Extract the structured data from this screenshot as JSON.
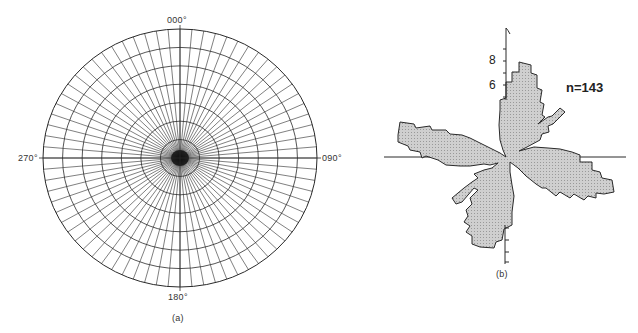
{
  "chart_data": [
    {
      "type": "polar-grid",
      "panel_label": "(a)",
      "title": "",
      "direction_labels": {
        "north": "000°",
        "east": "090°",
        "south": "180°",
        "west": "270°"
      },
      "grid": {
        "spoke_spacing_deg": 5,
        "spoke_count": 72,
        "concentric_circles": 7
      },
      "center": [
        180,
        158
      ],
      "radius_x": 137,
      "radius_y": 129
    },
    {
      "type": "rose",
      "panel_label": "(b)",
      "annotation": "n=143",
      "n": 143,
      "axis_tick_labels": [
        "6",
        "8"
      ],
      "axis_units_per_tick": 1,
      "center": [
        506,
        157
      ],
      "px_per_unit": 12,
      "petals": [
        {
          "name": "NNE",
          "direction_deg_approx": 15,
          "max_value_approx": 8
        },
        {
          "name": "WNW",
          "direction_deg_approx": 295,
          "max_value_approx": 9
        },
        {
          "name": "ESE",
          "direction_deg_approx": 110,
          "max_value_approx": 9
        },
        {
          "name": "SSW",
          "direction_deg_approx": 195,
          "max_value_approx": 8
        }
      ],
      "outline": [
        [
          506,
          157
        ],
        [
          503,
          150
        ],
        [
          500,
          140
        ],
        [
          499,
          125
        ],
        [
          500,
          110
        ],
        [
          500,
          100
        ],
        [
          506,
          98
        ],
        [
          506,
          82
        ],
        [
          512,
          82
        ],
        [
          512,
          72
        ],
        [
          519,
          72
        ],
        [
          519,
          62
        ],
        [
          531,
          65
        ],
        [
          531,
          73
        ],
        [
          537,
          75
        ],
        [
          537,
          88
        ],
        [
          542,
          90
        ],
        [
          540,
          102
        ],
        [
          544,
          104
        ],
        [
          542,
          115
        ],
        [
          545,
          117
        ],
        [
          538,
          124
        ],
        [
          548,
          117
        ],
        [
          552,
          116
        ],
        [
          556,
          112
        ],
        [
          560,
          108
        ],
        [
          565,
          112
        ],
        [
          553,
          124
        ],
        [
          548,
          126
        ],
        [
          549,
          132
        ],
        [
          542,
          134
        ],
        [
          540,
          140
        ],
        [
          527,
          147
        ],
        [
          519,
          151
        ],
        [
          534,
          147
        ],
        [
          548,
          148
        ],
        [
          560,
          149
        ],
        [
          572,
          152
        ],
        [
          580,
          155
        ],
        [
          580,
          162
        ],
        [
          592,
          162
        ],
        [
          592,
          170
        ],
        [
          600,
          172
        ],
        [
          602,
          178
        ],
        [
          612,
          180
        ],
        [
          614,
          192
        ],
        [
          604,
          194
        ],
        [
          596,
          193
        ],
        [
          596,
          198
        ],
        [
          588,
          196
        ],
        [
          584,
          200
        ],
        [
          574,
          194
        ],
        [
          570,
          198
        ],
        [
          560,
          192
        ],
        [
          556,
          196
        ],
        [
          546,
          188
        ],
        [
          542,
          188
        ],
        [
          536,
          184
        ],
        [
          526,
          176
        ],
        [
          518,
          168
        ],
        [
          510,
          162
        ],
        [
          510,
          172
        ],
        [
          512,
          185
        ],
        [
          514,
          196
        ],
        [
          512,
          212
        ],
        [
          512,
          225
        ],
        [
          504,
          229
        ],
        [
          502,
          240
        ],
        [
          496,
          242
        ],
        [
          494,
          248
        ],
        [
          480,
          247
        ],
        [
          472,
          244
        ],
        [
          472,
          236
        ],
        [
          466,
          232
        ],
        [
          470,
          226
        ],
        [
          464,
          222
        ],
        [
          468,
          216
        ],
        [
          466,
          210
        ],
        [
          472,
          204
        ],
        [
          470,
          198
        ],
        [
          478,
          190
        ],
        [
          474,
          188
        ],
        [
          462,
          202
        ],
        [
          456,
          204
        ],
        [
          452,
          198
        ],
        [
          464,
          188
        ],
        [
          472,
          182
        ],
        [
          478,
          178
        ],
        [
          474,
          174
        ],
        [
          484,
          170
        ],
        [
          492,
          168
        ],
        [
          498,
          163
        ],
        [
          490,
          165
        ],
        [
          484,
          164
        ],
        [
          470,
          166
        ],
        [
          460,
          166
        ],
        [
          446,
          165
        ],
        [
          438,
          160
        ],
        [
          426,
          156
        ],
        [
          422,
          158
        ],
        [
          420,
          152
        ],
        [
          410,
          150
        ],
        [
          408,
          146
        ],
        [
          398,
          142
        ],
        [
          398,
          135
        ],
        [
          400,
          122
        ],
        [
          414,
          124
        ],
        [
          416,
          128
        ],
        [
          430,
          126
        ],
        [
          432,
          130
        ],
        [
          446,
          130
        ],
        [
          450,
          134
        ],
        [
          462,
          135
        ],
        [
          470,
          138
        ],
        [
          478,
          142
        ],
        [
          490,
          148
        ],
        [
          500,
          153
        ]
      ]
    }
  ],
  "labels": {
    "north": "000°",
    "east": "090°",
    "south": "180°",
    "west": "270°",
    "panel_a": "(a)",
    "panel_b": "(b)",
    "n_annotation": "n=143",
    "tick_8": "8",
    "tick_6": "6"
  },
  "colors": {
    "line": "#2a2a2a",
    "petal_fill": "#cfcfcf",
    "background": "#ffffff"
  }
}
